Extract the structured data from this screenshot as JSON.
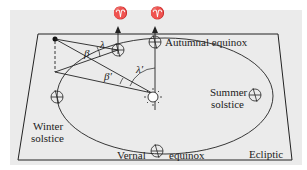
{
  "diagram": {
    "type": "ecliptic-orbit-geometry",
    "labels": {
      "autumnal_equinox": "Autumnal equinox",
      "summer_solstice_1": "Summer",
      "summer_solstice_2": "solstice",
      "winter_solstice_1": "Winter",
      "winter_solstice_2": "solstice",
      "vernal": "Vernal",
      "equinox": "equinox",
      "ecliptic": "Ecliptic"
    },
    "symbols": {
      "aries_1": "♈",
      "aries_2": "♈",
      "lambda": "λ",
      "beta": "β",
      "beta_prime": "β′",
      "lambda_prime": "λ′"
    },
    "colors": {
      "background": "#ebebeb",
      "line": "#222222"
    }
  }
}
